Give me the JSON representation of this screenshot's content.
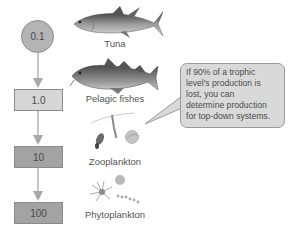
{
  "diagram": {
    "levels": [
      {
        "value": "0.1",
        "organism": "Tuna",
        "shape": "circle",
        "fill": "#b4b4b4"
      },
      {
        "value": "1.0",
        "organism": "Pelagic fishes",
        "shape": "box",
        "fill": "#d6d6d6"
      },
      {
        "value": "10",
        "organism": "Zooplankton",
        "shape": "box",
        "fill": "#a3a3a3"
      },
      {
        "value": "100",
        "organism": "Phytoplankton",
        "shape": "box",
        "fill": "#a3a3a3"
      }
    ],
    "icons": [
      "tuna-icon",
      "pelagic-fish-icon",
      "zooplankton-icon",
      "phytoplankton-icon"
    ],
    "arrow_color": "#a8a8a8",
    "callout": {
      "lines": [
        "If 90% of a trophic",
        "level's production is",
        "lost, you can",
        "determine production",
        "for top-down systems."
      ],
      "fill": "#d9d9d9"
    }
  }
}
